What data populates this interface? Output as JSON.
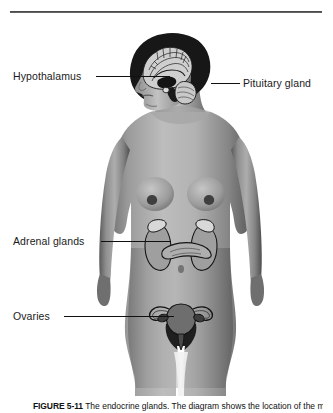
{
  "figure": {
    "background_color": "#ffffff",
    "divider_color": "#3a3a3a"
  },
  "labels": [
    {
      "id": "hypothalamus",
      "text": "Hypothalamus",
      "side": "left"
    },
    {
      "id": "pituitary",
      "text": "Pituitary gland",
      "side": "right"
    },
    {
      "id": "adrenal_glands",
      "text": "Adrenal glands",
      "side": "left"
    },
    {
      "id": "ovaries",
      "text": "Ovaries",
      "side": "left"
    }
  ],
  "caption": {
    "number": "FIGURE 5-11",
    "text": "The endocrine glands. The diagram shows the location of the major endocrine glands."
  },
  "anatomy": {
    "body_view": "anterior female figure, head in left-facing profile",
    "skin_tone_light": "#b9b9b9",
    "skin_tone_mid": "#8e8e8e",
    "skin_tone_dark": "#5f5f5f",
    "hair_color": "#1d1d1d",
    "organ_fill": "#b0b0b0",
    "organ_outline": "#151515",
    "structures": [
      "brain (cerebrum, cerebellum, brainstem)",
      "pituitary gland",
      "hypothalamus",
      "kidneys",
      "adrenal glands",
      "pancreas",
      "uterus",
      "fallopian tubes",
      "ovaries"
    ]
  }
}
